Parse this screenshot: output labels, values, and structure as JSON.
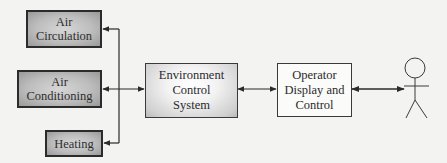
{
  "diagram": {
    "subsystems": [
      {
        "id": "air-circulation",
        "lines": [
          "Air",
          "Circulation"
        ]
      },
      {
        "id": "air-conditioning",
        "lines": [
          "Air",
          "Conditioning"
        ]
      },
      {
        "id": "heating",
        "lines": [
          "Heating"
        ]
      }
    ],
    "controller": {
      "lines": [
        "Environment",
        "Control",
        "System"
      ]
    },
    "interface": {
      "lines": [
        "Operator",
        "Display and",
        "Control"
      ]
    },
    "actor": {
      "icon": "stick-figure-person-icon"
    },
    "connections": [
      {
        "from": "environment-control-system",
        "to": "air-circulation",
        "type": "arrow"
      },
      {
        "from": "environment-control-system",
        "to": "air-conditioning",
        "type": "arrow"
      },
      {
        "from": "environment-control-system",
        "to": "heating",
        "type": "arrow"
      },
      {
        "from": "environment-control-system",
        "to": "operator-display-and-control",
        "type": "bidirectional-arrow"
      },
      {
        "from": "operator-display-and-control",
        "to": "operator",
        "type": "bidirectional-arrow"
      }
    ],
    "colors": {
      "line": "#2b2b2b",
      "subsystem_fill": "#bdbdbd",
      "background": "#f3f3f1"
    }
  }
}
